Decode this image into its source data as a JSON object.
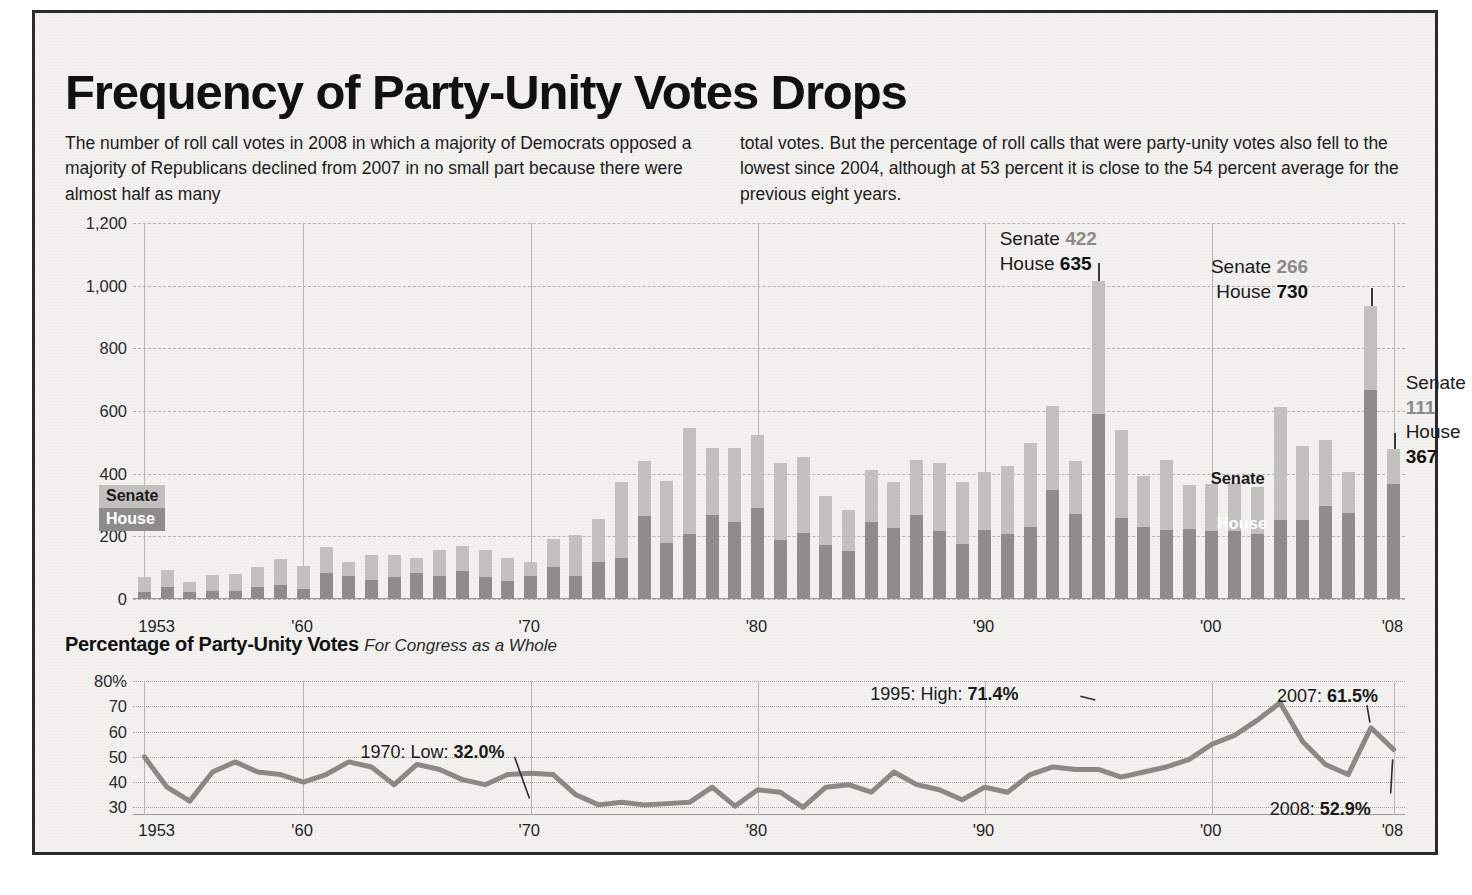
{
  "headline": "Frequency of Party-Unity Votes Drops",
  "deck": {
    "left": "The number of roll call votes in 2008 in which a majority of Democrats opposed a majority of Republicans declined from 2007 in no small part because there were almost half as many",
    "right": "total votes. But the percentage of roll calls that were party-unity votes also fell to the lowest since 2004, although at 53 percent it is close to the 54 percent average for the previous eight years."
  },
  "sub_head": {
    "bold": "Percentage of Party-Unity Votes",
    "italic": "For Congress as a Whole"
  },
  "legend": {
    "senate": "Senate",
    "house": "House"
  },
  "inchart": {
    "senate": "Senate",
    "house": "House"
  },
  "colors": {
    "senate": "#c2c1bd",
    "house": "#8e8d8a",
    "line": "#8a8984",
    "ink": "#111111",
    "panel": "#f2f1ee"
  },
  "callouts": [
    {
      "id": "callout-1995",
      "senate_label": "Senate",
      "senate_value": "422",
      "house_label": "House",
      "house_value": "635"
    },
    {
      "id": "callout-2007",
      "senate_label": "Senate",
      "senate_value": "266",
      "house_label": "House",
      "house_value": "730"
    },
    {
      "id": "callout-2008",
      "senate_label": "Senate",
      "senate_value": "111",
      "house_label": "House",
      "house_value": "367"
    }
  ],
  "annotations": [
    {
      "id": "ann-1970",
      "text_plain": "1970: Low: ",
      "text_bold": "32.0%"
    },
    {
      "id": "ann-1995",
      "text_plain": "1995: High: ",
      "text_bold": "71.4%"
    },
    {
      "id": "ann-2007",
      "text_plain": "2007: ",
      "text_bold": "61.5%"
    },
    {
      "id": "ann-2008",
      "text_plain": "2008: ",
      "text_bold": "52.9%"
    }
  ],
  "chart_data": [
    {
      "type": "bar",
      "id": "party-unity-vote-counts",
      "title": "Party-unity roll call votes by chamber",
      "stacked": true,
      "xlabel": "",
      "ylabel": "",
      "ylim": [
        0,
        1200
      ],
      "yticks": [
        0,
        200,
        400,
        600,
        800,
        1000,
        1200
      ],
      "ytick_labels": [
        "0",
        "200",
        "400",
        "600",
        "800",
        "1,000",
        "1,200"
      ],
      "grid": true,
      "x_tick_years": [
        1953,
        1960,
        1970,
        1980,
        1990,
        2000,
        2008
      ],
      "x_tick_labels": [
        "1953",
        "'60",
        "'70",
        "'80",
        "'90",
        "'00",
        "'08"
      ],
      "categories": [
        1953,
        1954,
        1955,
        1956,
        1957,
        1958,
        1959,
        1960,
        1961,
        1962,
        1963,
        1964,
        1965,
        1966,
        1967,
        1968,
        1969,
        1970,
        1971,
        1972,
        1973,
        1974,
        1975,
        1976,
        1977,
        1978,
        1979,
        1980,
        1981,
        1982,
        1983,
        1984,
        1985,
        1986,
        1987,
        1988,
        1989,
        1990,
        1991,
        1992,
        1993,
        1994,
        1995,
        1996,
        1997,
        1998,
        1999,
        2000,
        2001,
        2002,
        2003,
        2004,
        2005,
        2006,
        2007,
        2008
      ],
      "series": [
        {
          "name": "House",
          "color": "#8e8d8a",
          "values": [
            22,
            38,
            23,
            25,
            26,
            38,
            45,
            32,
            82,
            74,
            62,
            69,
            83,
            72,
            91,
            71,
            59,
            72,
            101,
            74,
            118,
            132,
            264,
            180,
            206,
            268,
            245,
            289,
            187,
            210,
            173,
            153,
            245,
            228,
            267,
            216,
            174,
            220,
            207,
            230,
            348,
            272,
            592,
            260,
            230,
            221,
            222,
            216,
            217,
            206,
            252,
            252,
            296,
            275,
            668,
            367
          ]
        },
        {
          "name": "Senate",
          "color": "#c2c1bd",
          "values": [
            48,
            54,
            32,
            51,
            54,
            64,
            82,
            74,
            85,
            45,
            80,
            73,
            47,
            83,
            77,
            87,
            72,
            46,
            92,
            129,
            138,
            242,
            176,
            196,
            339,
            213,
            236,
            234,
            247,
            243,
            156,
            131,
            166,
            147,
            177,
            218,
            201,
            186,
            217,
            269,
            267,
            169,
            422,
            279,
            164,
            222,
            143,
            151,
            152,
            153,
            360,
            235,
            211,
            129,
            266,
            111
          ]
        }
      ],
      "callout_points": [
        {
          "year": 1995,
          "House": 635,
          "Senate": 422
        },
        {
          "year": 2007,
          "House": 730,
          "Senate": 266
        },
        {
          "year": 2008,
          "House": 367,
          "Senate": 111
        }
      ]
    },
    {
      "type": "line",
      "id": "percentage-party-unity-votes",
      "title": "Percentage of Party-Unity Votes",
      "subtitle": "For Congress as a Whole",
      "xlabel": "",
      "ylabel": "",
      "ylim": [
        27,
        80
      ],
      "yticks": [
        30,
        40,
        50,
        60,
        70,
        80
      ],
      "ytick_labels": [
        "30",
        "40",
        "50",
        "60",
        "70",
        "80%"
      ],
      "grid": true,
      "x_tick_years": [
        1953,
        1960,
        1970,
        1980,
        1990,
        2000,
        2008
      ],
      "x_tick_labels": [
        "1953",
        "'60",
        "'70",
        "'80",
        "'90",
        "'00",
        "'08"
      ],
      "x": [
        1953,
        1954,
        1955,
        1956,
        1957,
        1958,
        1959,
        1960,
        1961,
        1962,
        1963,
        1964,
        1965,
        1966,
        1967,
        1968,
        1969,
        1970,
        1971,
        1972,
        1973,
        1974,
        1975,
        1976,
        1977,
        1978,
        1979,
        1980,
        1981,
        1982,
        1983,
        1984,
        1985,
        1986,
        1987,
        1988,
        1989,
        1990,
        1991,
        1992,
        1993,
        1994,
        1995,
        1996,
        1997,
        1998,
        1999,
        2000,
        2001,
        2002,
        2003,
        2004,
        2005,
        2006,
        2007,
        2008
      ],
      "values": [
        50.0,
        38.0,
        32.5,
        44.0,
        48.0,
        44.0,
        43.0,
        40.0,
        43.0,
        48.0,
        46.0,
        39.0,
        47.0,
        45.0,
        41.0,
        39.0,
        43.0,
        43.5,
        43.0,
        35.0,
        31.0,
        32.0,
        31.0,
        31.5,
        32.0,
        38.0,
        30.5,
        37.0,
        36.0,
        30.0,
        38.0,
        39.0,
        36.0,
        44.0,
        39.0,
        37.0,
        33.0,
        38.0,
        36.0,
        43.0,
        46.0,
        45.0,
        45.0,
        42.0,
        44.0,
        46.0,
        49.0,
        55.0,
        58.5,
        64.5,
        71.4,
        56.0,
        47.0,
        43.0,
        61.5,
        52.9
      ],
      "annotated_points": [
        {
          "year": 1970,
          "value": 32.0,
          "label": "1970: Low: 32.0%"
        },
        {
          "year": 1995,
          "value": 71.4,
          "label": "1995: High: 71.4%"
        },
        {
          "year": 2007,
          "value": 61.5,
          "label": "2007: 61.5%"
        },
        {
          "year": 2008,
          "value": 52.9,
          "label": "2008: 52.9%"
        }
      ]
    }
  ]
}
